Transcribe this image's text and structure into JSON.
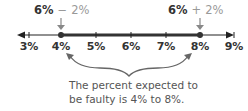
{
  "diagram": {
    "type": "number-line",
    "ticks": [
      "3%",
      "4%",
      "5%",
      "6%",
      "7%",
      "8%",
      "9%"
    ],
    "shaded_range": {
      "from": "4%",
      "to": "8%"
    },
    "left_label": {
      "value": "6%",
      "operator": "−",
      "delta": "2%"
    },
    "right_label": {
      "value": "6%",
      "operator": "+",
      "delta": "2%"
    },
    "caption_line1": "The percent expected to",
    "caption_line2": "be faulty is 4% to 8%."
  }
}
